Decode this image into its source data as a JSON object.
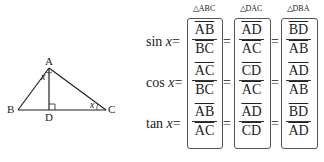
{
  "diagram": {
    "vertices": {
      "A": "A",
      "B": "B",
      "C": "C",
      "D": "D"
    },
    "angle_label": "x"
  },
  "columns": [
    {
      "triangle": "△ABC"
    },
    {
      "triangle": "△DAC"
    },
    {
      "triangle": "△DBA"
    }
  ],
  "rows": [
    {
      "func": "sin",
      "var": "x",
      "eq": "=",
      "fractions": [
        {
          "num": "AB",
          "den": "BC"
        },
        {
          "num": "AD",
          "den": "AC"
        },
        {
          "num": "BD",
          "den": "AB"
        }
      ]
    },
    {
      "func": "cos",
      "var": "x",
      "eq": "=",
      "fractions": [
        {
          "num": "AC",
          "den": "BC"
        },
        {
          "num": "CD",
          "den": "AC"
        },
        {
          "num": "AD",
          "den": "AB"
        }
      ]
    },
    {
      "func": "tan",
      "var": "x",
      "eq": "=",
      "fractions": [
        {
          "num": "AB",
          "den": "AC"
        },
        {
          "num": "AD",
          "den": "CD"
        },
        {
          "num": "BD",
          "den": "AD"
        }
      ]
    }
  ]
}
